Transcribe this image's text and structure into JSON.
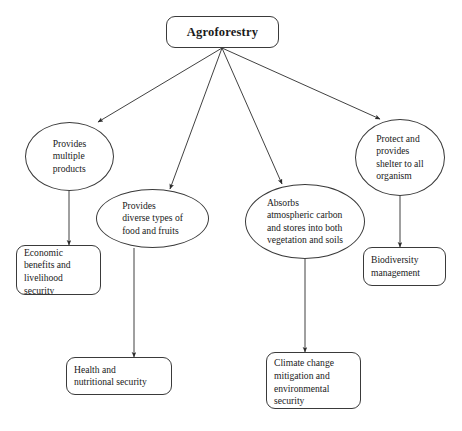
{
  "diagram": {
    "type": "flowchart",
    "background_color": "#ffffff",
    "stroke_color": "#3a3a3a",
    "text_color": "#1a1a1a",
    "root": {
      "label": "Agroforestry",
      "shape": "rounded-rectangle"
    },
    "branches": [
      {
        "id": "products",
        "shape": "ellipse",
        "label": "Provides\nmultiple\nproducts",
        "outcome": {
          "id": "economic",
          "shape": "rounded-rectangle",
          "label": "Economic\nbenefits and\nlivelihood\nsecurity"
        }
      },
      {
        "id": "food",
        "shape": "ellipse",
        "label": "Provides\ndiverse types of\nfood and fruits",
        "outcome": {
          "id": "health",
          "shape": "rounded-rectangle",
          "label": "Health and\nnutritional security"
        }
      },
      {
        "id": "carbon",
        "shape": "ellipse",
        "label": "Absorbs\natmospheric carbon\nand stores into both\nvegetation and soils",
        "outcome": {
          "id": "climate",
          "shape": "rounded-rectangle",
          "label": "Climate change\nmitigation and\nenvironmental\nsecurity"
        }
      },
      {
        "id": "shelter",
        "shape": "ellipse",
        "label": "Protect and\nprovides\nshelter to all\norganism",
        "outcome": {
          "id": "biodiversity",
          "shape": "rounded-rectangle",
          "label": "Biodiversity\nmanagement"
        }
      }
    ]
  }
}
